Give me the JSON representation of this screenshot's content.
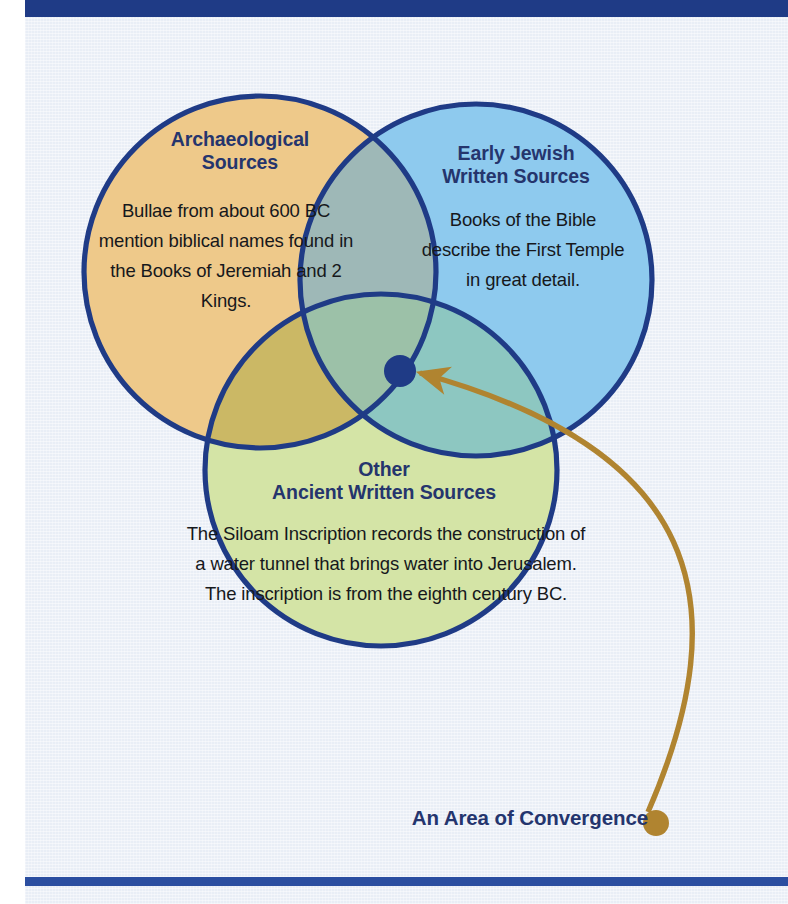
{
  "page": {
    "background_color": "#e9eef6",
    "gutter_color": "#ffffff",
    "top_bar_color": "#1f3b86",
    "bottom_rule_color": "#2b4ea0"
  },
  "diagram": {
    "type": "venn",
    "set_count": 3,
    "stroke_color": "#1f3b86",
    "circles": [
      {
        "id": "archaeological",
        "heading": "Archaeological\nSources",
        "heading_line1": "Archaeological",
        "heading_line2": "Sources",
        "body": "Bullae from about 600 BC mention biblical names found in the Books of Jeremiah and 2 Kings.",
        "fill_color": "#eec98a",
        "cx": 260,
        "cy": 272,
        "r": 176
      },
      {
        "id": "early-jewish",
        "heading": "Early Jewish\nWritten Sources",
        "heading_line1": "Early Jewish",
        "heading_line2": "Written Sources",
        "body": "Books of the Bible describe the First Temple in great detail.",
        "fill_color": "#8ecaee",
        "cx": 476,
        "cy": 280,
        "r": 176
      },
      {
        "id": "other-ancient",
        "heading": "Other\nAncient Written Sources",
        "heading_line1": "Other",
        "heading_line2": "Ancient Written Sources",
        "body": "The Siloam Inscription records the construction of a water tunnel that brings water into Jerusalem. The inscription is from the eighth century BC.",
        "fill_color": "#d4e4a6",
        "cx": 381,
        "cy": 470,
        "r": 176
      }
    ],
    "overlap_colors": {
      "archaeological_and_early_jewish": "#9eb8b7",
      "archaeological_and_other_ancient": "#cbb865",
      "early_jewish_and_other_ancient": "#8dc7c1",
      "all_three": "#9cc1a8"
    },
    "center_marker": {
      "label": "triple-intersection-dot",
      "color": "#1f3b86",
      "cx": 400,
      "cy": 371,
      "r": 16
    },
    "callout": {
      "label": "An Area of Convergence",
      "color": "#24356e",
      "arrow_color": "#b08430",
      "arrow_tail": {
        "x": 656,
        "y": 823
      },
      "arrow_head": {
        "x": 417,
        "y": 372
      },
      "tail_dot_radius": 13
    }
  }
}
